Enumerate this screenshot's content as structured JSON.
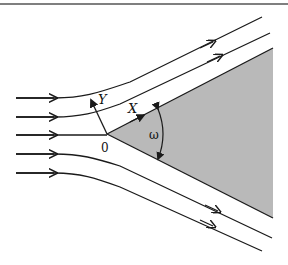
{
  "figure": {
    "labels": {
      "x_axis": "X",
      "y_axis": "Y",
      "origin": "0",
      "angle": "ω"
    },
    "colors": {
      "line": "#1a1a1a",
      "wedge_fill": "#b9b9b9",
      "border": "#555555"
    },
    "streamline_count": 5
  }
}
